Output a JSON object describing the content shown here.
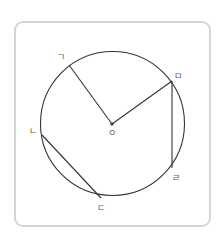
{
  "diagram": {
    "type": "circle-geometry",
    "stroke_color": "#333333",
    "frame_border_color": "#d6d6d6",
    "circle": {
      "cx": 112.5,
      "cy": 123.5,
      "r": 72
    },
    "center": {
      "label": "ㅇ",
      "x": 112,
      "y": 124
    },
    "points": [
      {
        "id": "giyeok",
        "label": "ㄱ",
        "x": 69,
        "y": 65,
        "label_x": 61,
        "label_y": 60
      },
      {
        "id": "mieum",
        "label": "ㅁ",
        "x": 172,
        "y": 81,
        "label_x": 178,
        "label_y": 79
      },
      {
        "id": "rieul",
        "label": "ㄹ",
        "x": 172,
        "y": 168,
        "label_x": 176,
        "label_y": 181
      },
      {
        "id": "nieun",
        "label": "ㄴ",
        "x": 42,
        "y": 135,
        "label_x": 33,
        "label_y": 134
      },
      {
        "id": "digeut",
        "label": "ㄷ",
        "x": 101,
        "y": 198,
        "label_x": 101,
        "label_y": 211
      }
    ],
    "segments": [
      {
        "from": "center",
        "to": "ㄱ",
        "kind": "radius"
      },
      {
        "from": "center",
        "to": "ㅁ",
        "kind": "radius"
      },
      {
        "from": "ㅁ",
        "to": "ㄹ",
        "kind": "chord"
      },
      {
        "from": "ㄴ",
        "to": "ㄷ",
        "kind": "chord"
      }
    ]
  }
}
